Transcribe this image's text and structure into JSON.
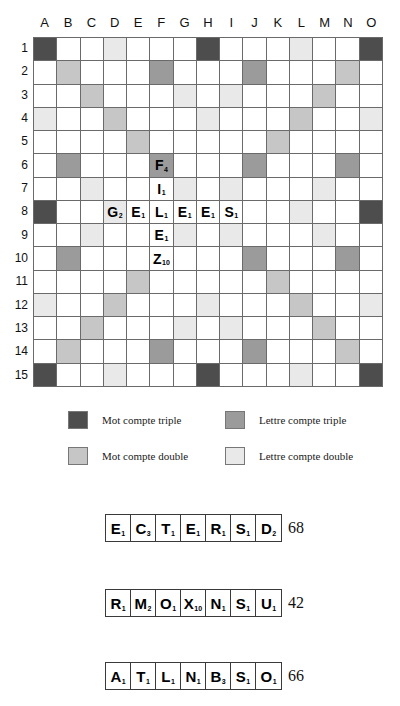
{
  "board": {
    "column_headers": [
      "A",
      "B",
      "C",
      "D",
      "E",
      "F",
      "G",
      "H",
      "I",
      "J",
      "K",
      "L",
      "M",
      "N",
      "O"
    ],
    "row_headers": [
      "1",
      "2",
      "3",
      "4",
      "5",
      "6",
      "7",
      "8",
      "9",
      "10",
      "11",
      "12",
      "13",
      "14",
      "15"
    ],
    "size": 15,
    "premiums": {
      "triple_word": [
        "A1",
        "H1",
        "O1",
        "A8",
        "O8",
        "A15",
        "H15",
        "O15"
      ],
      "double_word": [
        "B2",
        "N2",
        "C3",
        "M3",
        "D4",
        "L4",
        "E5",
        "K5",
        "E11",
        "K11",
        "D12",
        "L12",
        "C13",
        "M13",
        "B14",
        "N14"
      ],
      "triple_letter": [
        "F2",
        "J2",
        "B6",
        "F6",
        "J6",
        "N6",
        "B10",
        "J10",
        "N10",
        "F14",
        "J14"
      ],
      "double_letter": [
        "D1",
        "L1",
        "G3",
        "I3",
        "A4",
        "H4",
        "O4",
        "C7",
        "G7",
        "I7",
        "D8",
        "L8",
        "C9",
        "G9",
        "I9",
        "M9",
        "M7",
        "A12",
        "H12",
        "O12",
        "G13",
        "I13",
        "D15",
        "L15"
      ]
    },
    "tiles": [
      {
        "cell": "F6",
        "letter": "F",
        "value": "4"
      },
      {
        "cell": "F7",
        "letter": "I",
        "value": "1"
      },
      {
        "cell": "D8",
        "letter": "G",
        "value": "2"
      },
      {
        "cell": "E8",
        "letter": "E",
        "value": "1"
      },
      {
        "cell": "F8",
        "letter": "L",
        "value": "1"
      },
      {
        "cell": "G8",
        "letter": "E",
        "value": "1"
      },
      {
        "cell": "H8",
        "letter": "E",
        "value": "1"
      },
      {
        "cell": "I8",
        "letter": "S",
        "value": "1"
      },
      {
        "cell": "F9",
        "letter": "E",
        "value": "1"
      },
      {
        "cell": "F10",
        "letter": "Z",
        "value": "10"
      }
    ]
  },
  "legend": {
    "triple_word": "Mot compte triple",
    "double_word": "Mot compte double",
    "triple_letter": "Lettre compte triple",
    "double_letter": "Lettre compte double",
    "colors": {
      "triple_word": "#4d4d4d",
      "double_word": "#c6c6c6",
      "triple_letter": "#9b9b9b",
      "double_letter": "#e9e9e9"
    }
  },
  "racks": [
    {
      "tiles": [
        {
          "letter": "E",
          "value": "1"
        },
        {
          "letter": "C",
          "value": "3"
        },
        {
          "letter": "T",
          "value": "1"
        },
        {
          "letter": "E",
          "value": "1"
        },
        {
          "letter": "R",
          "value": "1"
        },
        {
          "letter": "S",
          "value": "1"
        },
        {
          "letter": "D",
          "value": "2"
        }
      ],
      "score": "68"
    },
    {
      "tiles": [
        {
          "letter": "R",
          "value": "1"
        },
        {
          "letter": "M",
          "value": "2"
        },
        {
          "letter": "O",
          "value": "1"
        },
        {
          "letter": "X",
          "value": "10"
        },
        {
          "letter": "N",
          "value": "1"
        },
        {
          "letter": "S",
          "value": "1"
        },
        {
          "letter": "U",
          "value": "1"
        }
      ],
      "score": "42"
    },
    {
      "tiles": [
        {
          "letter": "A",
          "value": "1"
        },
        {
          "letter": "T",
          "value": "1"
        },
        {
          "letter": "L",
          "value": "1"
        },
        {
          "letter": "N",
          "value": "1"
        },
        {
          "letter": "B",
          "value": "3"
        },
        {
          "letter": "S",
          "value": "1"
        },
        {
          "letter": "O",
          "value": "1"
        }
      ],
      "score": "66"
    }
  ]
}
